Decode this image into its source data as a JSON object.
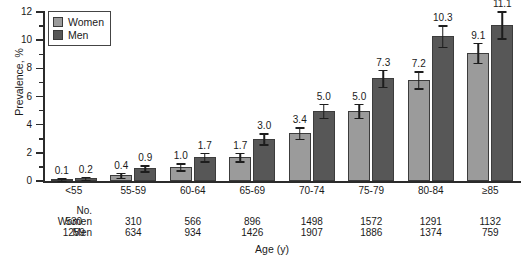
{
  "chart_data": {
    "type": "bar",
    "title": "",
    "xlabel": "Age (y)",
    "ylabel": "Prevalence, %",
    "ylim": [
      0,
      12
    ],
    "yticks": [
      0,
      2,
      4,
      6,
      8,
      10,
      12
    ],
    "yticks_minor": [
      1,
      3,
      5,
      7,
      9,
      11
    ],
    "grid": false,
    "legend_position": "top-left",
    "categories": [
      "<55",
      "55-59",
      "60-64",
      "65-69",
      "70-74",
      "75-79",
      "80-84",
      "≥85"
    ],
    "series": [
      {
        "name": "Women",
        "color": "#9b9b9b",
        "values": [
          0.1,
          0.4,
          1.0,
          1.7,
          3.4,
          5.0,
          7.2,
          9.1
        ],
        "labels": [
          "0.1",
          "0.4",
          "1.0",
          "1.7",
          "3.4",
          "5.0",
          "7.2",
          "9.1"
        ],
        "errors": [
          0.08,
          0.18,
          0.25,
          0.3,
          0.4,
          0.5,
          0.6,
          0.7
        ]
      },
      {
        "name": "Men",
        "color": "#575757",
        "values": [
          0.2,
          0.9,
          1.7,
          3.0,
          5.0,
          7.3,
          10.3,
          11.1
        ],
        "labels": [
          "0.2",
          "0.9",
          "1.7",
          "3.0",
          "5.0",
          "7.3",
          "10.3",
          "11.1"
        ],
        "errors": [
          0.1,
          0.22,
          0.3,
          0.4,
          0.5,
          0.6,
          0.75,
          0.95
        ]
      }
    ],
    "table": {
      "header_label": "No.",
      "rows": [
        {
          "label": "Women",
          "values": [
            "530",
            "310",
            "566",
            "896",
            "1498",
            "1572",
            "1291",
            "1132"
          ]
        },
        {
          "label": "Men",
          "values": [
            "1259",
            "634",
            "934",
            "1426",
            "1907",
            "1886",
            "1374",
            "759"
          ]
        }
      ]
    }
  }
}
